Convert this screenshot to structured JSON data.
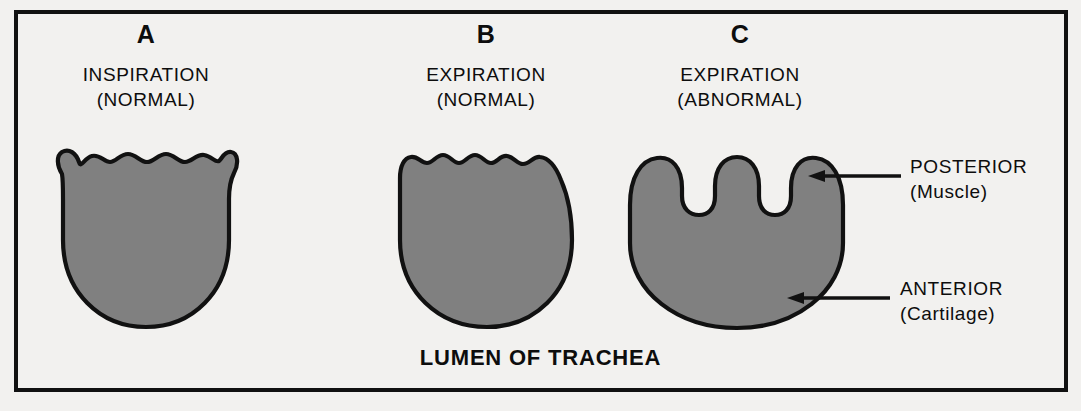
{
  "figure": {
    "background_color": "#f2f1ef",
    "frame_color": "#111111",
    "lumen_fill_color": "#808080",
    "lumen_outline_color": "#111111"
  },
  "panels": [
    {
      "letter": "A",
      "phase": "INSPIRATION",
      "qualifier": "(NORMAL)",
      "shape_name": "horseshoe-lumen-wide-open"
    },
    {
      "letter": "B",
      "phase": "EXPIRATION",
      "qualifier": "(NORMAL)",
      "shape_name": "rounded-lumen-slightly-narrowed"
    },
    {
      "letter": "C",
      "phase": "EXPIRATION",
      "qualifier": "(ABNORMAL)",
      "shape_name": "collapsed-lumen-posterior-invagination"
    }
  ],
  "annotations": [
    {
      "label": "POSTERIOR",
      "sub": "(Muscle)",
      "arrow": "left-arrow-posterior"
    },
    {
      "label": "ANTERIOR",
      "sub": "(Cartilage)",
      "arrow": "left-arrow-anterior"
    }
  ],
  "bottom_caption": "LUMEN OF TRACHEA"
}
